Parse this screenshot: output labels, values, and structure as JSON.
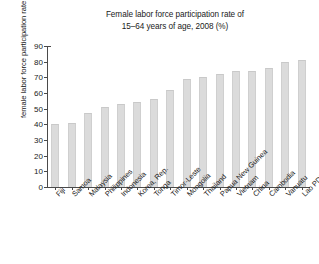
{
  "chart_data": {
    "type": "bar",
    "title": "Female labor force participation rate of 15–64 years of age, 2008 (%)",
    "title_lines": [
      "Female labor force participation rate of",
      "15–64 years of age, 2008 (%)"
    ],
    "xlabel": "",
    "ylabel": "female labor force participation rate (%)",
    "ylim": [
      0,
      90
    ],
    "ytick_labels": [
      "0",
      "10",
      "20",
      "30",
      "40",
      "50",
      "60",
      "70",
      "80",
      "90"
    ],
    "yticks": [
      0,
      10,
      20,
      30,
      40,
      50,
      60,
      70,
      80,
      90
    ],
    "grid": false,
    "legend": false,
    "bar_color": "#dbdbdb",
    "axis_color": "#4a4a4a",
    "categories": [
      "Fiji",
      "Samoa",
      "Malaysia",
      "Philippines",
      "Indonesia",
      "Korea, Rep.",
      "Tonga",
      "Timor-Leste",
      "Mongolia",
      "Thailand",
      "Papua New Guinea",
      "Vietnam",
      "China",
      "Cambodia",
      "Vanuatu",
      "Lao PDR"
    ],
    "values": [
      40,
      41,
      47,
      51,
      53,
      54,
      56,
      62,
      69,
      70,
      72,
      74,
      74,
      76,
      80,
      81
    ]
  }
}
